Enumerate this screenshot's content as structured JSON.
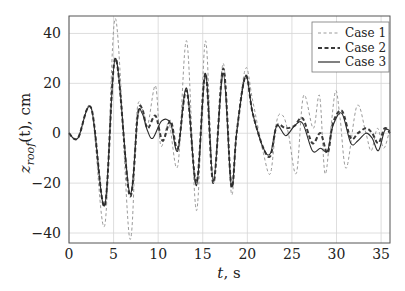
{
  "chart_data": {
    "type": "line",
    "title": "",
    "xlabel": "t, s",
    "ylabel": "z_roof(t), cm",
    "xlim": [
      0,
      36
    ],
    "ylim": [
      -44,
      47
    ],
    "xticks": [
      0,
      5,
      10,
      15,
      20,
      25,
      30,
      35
    ],
    "yticks": [
      -40,
      -20,
      0,
      20,
      40
    ],
    "grid": true,
    "legend_position": "upper right",
    "series": [
      {
        "name": "Case 1",
        "style": "dashed-light",
        "x": [
          0,
          1,
          2.5,
          4,
          5.2,
          6.8,
          7.6,
          8.2,
          8.8,
          9.7,
          10.3,
          11.2,
          12.2,
          13.2,
          14.3,
          15.3,
          16.2,
          17.3,
          18.2,
          18.8,
          19.8,
          20.6,
          21.8,
          22.6,
          23.3,
          24,
          24.6,
          25.5,
          26.3,
          27.4,
          28.1,
          28.7,
          29.3,
          29.9,
          30.4,
          31.1,
          32.3,
          33.3,
          33.9,
          34.6,
          35.3,
          36
        ],
        "y": [
          0,
          -2,
          10,
          -37,
          46,
          -42,
          8,
          10,
          3,
          19,
          -5,
          4,
          -13,
          37,
          -31,
          37,
          -20,
          28,
          -24,
          0,
          26,
          13,
          -8,
          -16,
          5,
          7,
          0,
          -16,
          15,
          2,
          15,
          -16,
          0,
          17,
          6,
          -14,
          11,
          0,
          -7,
          2,
          -6,
          2
        ]
      },
      {
        "name": "Case 2",
        "style": "dashed-dark",
        "x": [
          0,
          1,
          2.5,
          4,
          5.2,
          6.8,
          7.7,
          8.2,
          8.8,
          9.7,
          10.5,
          11.4,
          12.2,
          13.2,
          14.3,
          15.3,
          16.2,
          17.3,
          18.2,
          18.8,
          19.8,
          20.6,
          21.8,
          22.6,
          23.3,
          24.3,
          25.3,
          26.2,
          27.3,
          28.2,
          29,
          29.6,
          30.6,
          31.6,
          32.4,
          33.3,
          34,
          34.7,
          35.4,
          36
        ],
        "y": [
          0,
          -2,
          10,
          -29,
          30,
          -25,
          7,
          10,
          2,
          7,
          -3,
          5,
          -6,
          17,
          -20,
          24,
          -20,
          26,
          -21,
          0,
          23,
          8,
          -6,
          -9,
          3,
          2,
          3,
          6,
          -4,
          0,
          -8,
          4,
          9,
          -2,
          0,
          2,
          0,
          -4,
          2,
          0
        ]
      },
      {
        "name": "Case 3",
        "style": "solid",
        "x": [
          0,
          1,
          2.5,
          4,
          5.2,
          6.8,
          7.7,
          8.2,
          8.8,
          9.4,
          10.4,
          11.4,
          12.2,
          13.2,
          14.3,
          15.3,
          16.2,
          17.3,
          18.2,
          18.8,
          19.8,
          20.6,
          21.8,
          22.6,
          23.3,
          24.3,
          25.3,
          26.2,
          27.3,
          28.2,
          29,
          29.6,
          30.6,
          31.6,
          32.4,
          33.3,
          34,
          34.7,
          35.4,
          36
        ],
        "y": [
          0,
          -2,
          10,
          -29,
          30,
          -24,
          7,
          8,
          1,
          -2,
          5,
          4,
          -7,
          18,
          -21,
          24,
          -19,
          24,
          -21,
          0,
          23,
          8,
          -6,
          -8,
          3,
          -1,
          3,
          4,
          -7,
          -6,
          -7,
          3,
          8,
          -4,
          -3,
          0,
          -2,
          -7,
          1,
          1
        ]
      }
    ]
  },
  "axes": {
    "xlabel_t": "t",
    "xlabel_rest": ", s",
    "ylabel_z": "z",
    "ylabel_sub": "roof",
    "ylabel_rest": "(t), cm"
  },
  "legend": {
    "items": [
      "Case 1",
      "Case 2",
      "Case 3"
    ]
  },
  "colors": {
    "case1": "#9a9a9a",
    "case2": "#3a3a3a",
    "case3": "#2a2a2a",
    "grid": "#d6d6d6",
    "axis": "#444444"
  }
}
